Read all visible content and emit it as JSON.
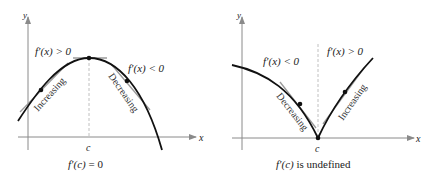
{
  "figures": [
    {
      "id": "left",
      "axis_x_label": "x",
      "axis_y_label": "y",
      "point_label": "c",
      "left_annotation": "f′(x) > 0",
      "right_annotation": "f′(x) < 0",
      "left_curve_label": "Increasing",
      "right_curve_label": "Decreasing",
      "caption_lhs": "f′(c)",
      "caption_rest": " = 0",
      "description": "smooth maximum with horizontal tangent at c"
    },
    {
      "id": "right",
      "axis_x_label": "x",
      "axis_y_label": "y",
      "point_label": "c",
      "left_annotation": "f′(x) < 0",
      "right_annotation": "f′(x) > 0",
      "left_curve_label": "Decreasing",
      "right_curve_label": "Increasing",
      "caption_lhs": "f′(c)",
      "caption_rest": " is undefined",
      "description": "cusp minimum at c where derivative is undefined"
    }
  ],
  "colors": {
    "curve": "#111111",
    "axis": "#8a8a8a",
    "tangent": "#9a9a9a",
    "dashed": "#b0b0b0"
  }
}
